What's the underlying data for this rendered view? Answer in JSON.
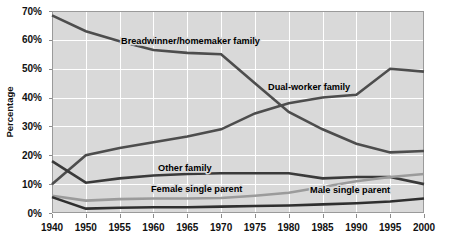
{
  "chart_data": {
    "type": "line",
    "title": "",
    "xlabel": "",
    "ylabel": "Percentage",
    "x": [
      1940,
      1950,
      1955,
      1960,
      1965,
      1970,
      1975,
      1980,
      1985,
      1990,
      1995,
      2000
    ],
    "xtick_labels": [
      "1940",
      "1950",
      "1955",
      "1960",
      "1965",
      "1970",
      "1975",
      "1980",
      "1985",
      "1990",
      "1995",
      "2000"
    ],
    "ytick_labels": [
      "0%",
      "10%",
      "20%",
      "30%",
      "40%",
      "50%",
      "60%",
      "70%"
    ],
    "yticks": [
      0,
      10,
      20,
      30,
      40,
      50,
      60,
      70
    ],
    "ylim": [
      0,
      70
    ],
    "grid": true,
    "legend_position": "inline-annotations",
    "series": [
      {
        "name": "Breadwinner/homemaker family",
        "color": "#4d4d4d",
        "width": 2.6,
        "values": [
          68.5,
          63.0,
          59.5,
          56.5,
          55.5,
          55.0,
          45.0,
          35.0,
          29.0,
          24.0,
          21.0,
          21.5
        ],
        "label": "Breadwinner/homemaker family",
        "label_x": 121,
        "label_y": 44
      },
      {
        "name": "Dual-worker family",
        "color": "#4d4d4d",
        "width": 2.6,
        "values": [
          10.0,
          20.0,
          22.5,
          24.5,
          26.5,
          29.0,
          34.5,
          38.0,
          40.0,
          41.0,
          50.0,
          49.0
        ],
        "label": "Dual-worker family",
        "label_x": 268,
        "label_y": 90
      },
      {
        "name": "Other family",
        "color": "#3a3a3a",
        "width": 2.6,
        "values": [
          18.0,
          10.5,
          12.0,
          13.0,
          13.5,
          13.8,
          13.8,
          13.8,
          12.0,
          12.5,
          12.5,
          10.0
        ],
        "label": "Other family",
        "label_x": 158,
        "label_y": 171
      },
      {
        "name": "Female single parent",
        "color": "#9b9b9b",
        "width": 2.6,
        "values": [
          6.0,
          4.3,
          4.8,
          5.0,
          5.0,
          5.2,
          6.0,
          7.0,
          9.0,
          11.0,
          12.5,
          13.5
        ],
        "label": "Female single parent",
        "label_x": 151,
        "label_y": 192
      },
      {
        "name": "Male single parent",
        "color": "#2f2f2f",
        "width": 2.6,
        "values": [
          5.5,
          1.5,
          1.8,
          2.0,
          2.0,
          2.2,
          2.4,
          2.6,
          3.0,
          3.4,
          4.0,
          5.0
        ],
        "label": "Male single parent",
        "label_x": 310,
        "label_y": 193
      }
    ]
  }
}
